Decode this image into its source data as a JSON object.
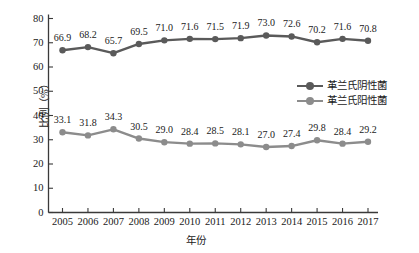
{
  "chart_data": {
    "type": "line",
    "title": "",
    "xlabel": "年份",
    "ylabel": "比例（%）",
    "categories": [
      "2005",
      "2006",
      "2007",
      "2008",
      "2009",
      "2010",
      "2011",
      "2012",
      "2013",
      "2014",
      "2015",
      "2016",
      "2017"
    ],
    "series": [
      {
        "name": "革兰氏阴性菌",
        "color": "#5a5a5a",
        "values": [
          66.9,
          68.2,
          65.7,
          69.5,
          71.0,
          71.6,
          71.5,
          71.9,
          73.0,
          72.6,
          70.2,
          71.6,
          70.8
        ],
        "labels": [
          "66.9",
          "68.2",
          "65.7",
          "69.5",
          "71.0",
          "71.6",
          "71.5",
          "71.9",
          "73.0",
          "72.6",
          "70.2",
          "71.6",
          "70.8"
        ]
      },
      {
        "name": "革兰氏阳性菌",
        "color": "#8c8c8c",
        "values": [
          33.1,
          31.8,
          34.3,
          30.5,
          29.0,
          28.4,
          28.5,
          28.1,
          27.0,
          27.4,
          29.8,
          28.4,
          29.2
        ],
        "labels": [
          "33.1",
          "31.8",
          "34.3",
          "30.5",
          "29.0",
          "28.4",
          "28.5",
          "28.1",
          "27.0",
          "27.4",
          "29.8",
          "28.4",
          "29.2"
        ]
      }
    ],
    "ylim": [
      0,
      80
    ],
    "yticks": [
      0,
      10,
      20,
      30,
      40,
      50,
      60,
      70,
      80
    ],
    "ytick_labels": [
      "0",
      "10",
      "20",
      "30",
      "40",
      "50",
      "60",
      "70",
      "80"
    ],
    "grid": false,
    "legend_position": "center-right",
    "axis_color": "#3a3a3a"
  }
}
